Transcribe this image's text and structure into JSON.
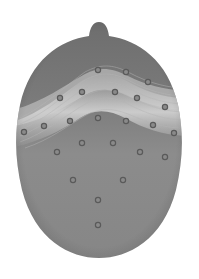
{
  "figure": {
    "type": "scalp-topography-map",
    "colors": {
      "background": "#ffffff",
      "scalp_dark": "#6f6f6f",
      "scalp_mid": "#8a8a8a",
      "highlight_band": "#c9c9c9",
      "electrode": "#5a5a5a"
    },
    "head": {
      "cx": 99,
      "cy": 150,
      "rx": 84,
      "ry": 110,
      "nose_x": 99,
      "nose_top_y": 22
    },
    "electrodes": [
      {
        "x": 98,
        "y": 70
      },
      {
        "x": 126,
        "y": 72
      },
      {
        "x": 148,
        "y": 82
      },
      {
        "x": 60,
        "y": 98
      },
      {
        "x": 82,
        "y": 92
      },
      {
        "x": 115,
        "y": 92
      },
      {
        "x": 137,
        "y": 98
      },
      {
        "x": 165,
        "y": 107
      },
      {
        "x": 44,
        "y": 126
      },
      {
        "x": 70,
        "y": 121
      },
      {
        "x": 98,
        "y": 118
      },
      {
        "x": 126,
        "y": 121
      },
      {
        "x": 153,
        "y": 125
      },
      {
        "x": 24,
        "y": 132
      },
      {
        "x": 174,
        "y": 133
      },
      {
        "x": 82,
        "y": 143
      },
      {
        "x": 113,
        "y": 143
      },
      {
        "x": 57,
        "y": 152
      },
      {
        "x": 140,
        "y": 152
      },
      {
        "x": 165,
        "y": 157
      },
      {
        "x": 73,
        "y": 180
      },
      {
        "x": 123,
        "y": 180
      },
      {
        "x": 98,
        "y": 200
      },
      {
        "x": 98,
        "y": 225
      }
    ]
  }
}
